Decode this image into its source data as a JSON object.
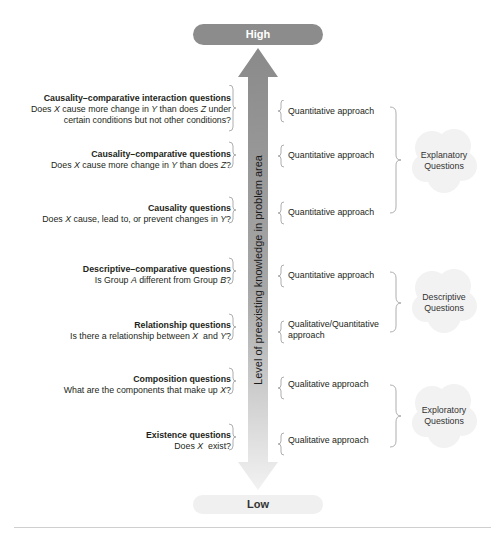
{
  "axis": {
    "top_label": "High",
    "bottom_label": "Low",
    "label": "Level of preexisting knowledge in problem area",
    "top_color": "#8c8c8c",
    "bottom_color": "#f0f0f0"
  },
  "questions": [
    {
      "title": "Causality–comparative interaction questions",
      "lines": [
        "Does X cause more change in Y than does Z under",
        "certain conditions but not other conditions?"
      ],
      "approach": "Quantitative approach"
    },
    {
      "title": "Causality–comparative questions",
      "lines": [
        "Does X cause more change in Y than does Z?"
      ],
      "approach": "Quantitative approach"
    },
    {
      "title": "Causality questions",
      "lines": [
        "Does X cause, lead to, or prevent changes in Y?"
      ],
      "approach": "Quantitative approach"
    },
    {
      "title": "Descriptive–comparative questions",
      "lines": [
        "Is Group A different from Group B?"
      ],
      "approach": "Quantitative approach"
    },
    {
      "title": "Relationship questions",
      "lines": [
        "Is there a relationship between X  and Y?"
      ],
      "approach": "Qualitative/Quantitative",
      "approach_line2": "approach"
    },
    {
      "title": "Composition questions",
      "lines": [
        "What are the components that make up X?"
      ],
      "approach": "Qualitative approach"
    },
    {
      "title": "Existence questions",
      "lines": [
        "Does X  exist?"
      ],
      "approach": "Qualitative approach"
    }
  ],
  "groups": [
    {
      "line1": "Explanatory",
      "line2": "Questions"
    },
    {
      "line1": "Descriptive",
      "line2": "Questions"
    },
    {
      "line1": "Exploratory",
      "line2": "Questions"
    }
  ]
}
